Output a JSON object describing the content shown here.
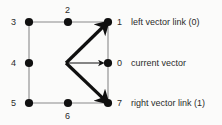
{
  "figure": {
    "background_color": "#fbfbfa",
    "ink_color": "#101010",
    "edge_color": "#8a8a8a",
    "text_color": "#2b2b2b"
  },
  "nodes": [
    {
      "id": "n0",
      "label": "0",
      "x": 108,
      "y": 63,
      "label_x": 117,
      "label_y": 59
    },
    {
      "id": "n1",
      "label": "1",
      "x": 108,
      "y": 22,
      "label_x": 117,
      "label_y": 18
    },
    {
      "id": "n2",
      "label": "2",
      "x": 68,
      "y": 22,
      "label_x": 65,
      "label_y": 6
    },
    {
      "id": "n3",
      "label": "3",
      "x": 29,
      "y": 22,
      "label_x": 11,
      "label_y": 18
    },
    {
      "id": "n4",
      "label": "4",
      "x": 29,
      "y": 63,
      "label_x": 11,
      "label_y": 59
    },
    {
      "id": "n5",
      "label": "5",
      "x": 29,
      "y": 103,
      "label_x": 11,
      "label_y": 99
    },
    {
      "id": "n6",
      "label": "6",
      "x": 68,
      "y": 103,
      "label_x": 65,
      "label_y": 112
    },
    {
      "id": "n7",
      "label": "7",
      "x": 108,
      "y": 103,
      "label_x": 117,
      "label_y": 99
    }
  ],
  "edges": [
    {
      "from": "n3",
      "to": "n2"
    },
    {
      "from": "n2",
      "to": "n1"
    },
    {
      "from": "n3",
      "to": "n4"
    },
    {
      "from": "n4",
      "to": "n5"
    },
    {
      "from": "n5",
      "to": "n6"
    },
    {
      "from": "n6",
      "to": "n7"
    },
    {
      "from": "n1",
      "to": "n0"
    },
    {
      "from": "n0",
      "to": "n7"
    }
  ],
  "vectors": {
    "origin_x": 66,
    "origin_y": 63,
    "items": [
      {
        "id": "left-vector",
        "to": "n1",
        "weight": "thick"
      },
      {
        "id": "current-vector",
        "to": "n0",
        "weight": "thin"
      },
      {
        "id": "right-vector",
        "to": "n7",
        "weight": "thick"
      }
    ]
  },
  "legend": [
    {
      "id": "left",
      "number": "1",
      "text": "left vector link (0)",
      "x": 131,
      "y": 18
    },
    {
      "id": "current",
      "number": "0",
      "text": "current vector",
      "x": 131,
      "y": 59
    },
    {
      "id": "right",
      "number": "7",
      "text": "right vector link (1)",
      "x": 131,
      "y": 99
    }
  ]
}
